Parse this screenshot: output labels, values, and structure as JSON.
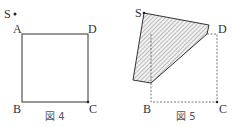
{
  "figure4": {
    "caption": "図 4",
    "labels": {
      "S": "S",
      "A": "A",
      "D": "D",
      "B": "B",
      "C": "C"
    }
  },
  "figure5": {
    "caption": "図 5",
    "labels": {
      "S": "S",
      "D": "D",
      "B": "B",
      "C": "C"
    }
  },
  "colors": {
    "line": "#333333",
    "hatch": "#555555",
    "fill": "#e8e8e8"
  }
}
